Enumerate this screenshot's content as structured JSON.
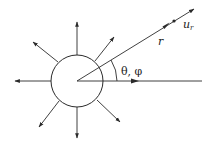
{
  "diagram": {
    "type": "radial-emission-sketch",
    "colors": {
      "stroke": "#2a2a2a",
      "background": "#ffffff"
    },
    "labels": {
      "unit_vector": "u",
      "unit_vector_subscript": "r",
      "radius": "r",
      "angles": "θ, φ"
    },
    "elements": {
      "source_circle": {
        "cx": 77,
        "cy": 81,
        "r": 26
      },
      "outward_arrows": 8,
      "radial_line": "from center toward upper right",
      "reference_axis": "horizontal line to the right",
      "angle_arc": "between reference axis and radial line"
    }
  }
}
